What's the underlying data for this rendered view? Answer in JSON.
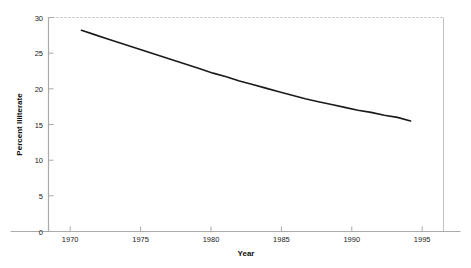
{
  "chart_data": {
    "type": "line",
    "title": "",
    "xlabel": "Year",
    "ylabel": "Percent Illiterate",
    "xlim": [
      1967.5,
      1997.5
    ],
    "ylim": [
      0,
      30
    ],
    "grid": false,
    "legend": null,
    "x_ticks": [
      1970,
      1975,
      1980,
      1985,
      1990,
      1995
    ],
    "x_tick_labels": [
      "1970",
      "1975",
      "1980",
      "1985",
      "1990",
      "1995"
    ],
    "y_ticks": [
      0,
      5,
      10,
      15,
      20,
      25,
      30
    ],
    "y_tick_labels": [
      "0",
      "5",
      "10",
      "15",
      "20",
      "25",
      "30"
    ],
    "series": [
      {
        "name": "Percent Illiterate",
        "color": "#1a1a1a",
        "line_width": 1.6,
        "x": [
          1970,
          1971,
          1972,
          1973,
          1974,
          1975,
          1976,
          1977,
          1978,
          1979,
          1980,
          1981,
          1982,
          1983,
          1984,
          1985,
          1986,
          1987,
          1988,
          1989,
          1990,
          1991,
          1992,
          1993,
          1994,
          1995
        ],
        "values": [
          28.2,
          27.6,
          27.0,
          26.4,
          25.8,
          25.2,
          24.6,
          24.0,
          23.4,
          22.8,
          22.2,
          21.7,
          21.1,
          20.6,
          20.1,
          19.6,
          19.1,
          18.6,
          18.2,
          17.8,
          17.4,
          17.0,
          16.7,
          16.3,
          16.0,
          15.5
        ]
      }
    ],
    "annotations": []
  },
  "axes": {
    "y_axis_title": "Percent Illiterate",
    "x_axis_title": "Year",
    "frame": {
      "top_line_style": "dotted",
      "right_line_style": "solid",
      "bottom_line_style": "solid",
      "left_line_style": "solid",
      "frame_color": "#b9b9b9"
    }
  },
  "colors": {
    "background": "#ffffff",
    "line": "#1a1a1a",
    "axis": "#b0b0b0",
    "text": "#1a1a1a"
  }
}
